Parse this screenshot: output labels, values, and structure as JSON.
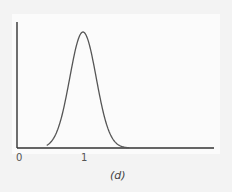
{
  "figure": {
    "caption": "(d)",
    "x_ticks": [
      "0",
      "1"
    ]
  },
  "colors": {
    "axis": "#333333",
    "curve": "#555555",
    "background": "#f3f3f3"
  },
  "chart_data": {
    "type": "line",
    "title": "",
    "caption": "(d)",
    "xlabel": "",
    "ylabel": "",
    "x_tick_labels": [
      "0",
      "1"
    ],
    "y_tick_labels": [],
    "grid": false,
    "legend": null,
    "xlim": [
      0,
      3
    ],
    "ylim": [
      0,
      1.1
    ],
    "series": [
      {
        "name": "density",
        "x": [
          0.45,
          0.55,
          0.65,
          0.75,
          0.85,
          0.95,
          1.0,
          1.05,
          1.15,
          1.25,
          1.35,
          1.45,
          1.55,
          1.7
        ],
        "y": [
          0.0,
          0.03,
          0.12,
          0.33,
          0.65,
          0.93,
          1.0,
          0.95,
          0.74,
          0.45,
          0.22,
          0.08,
          0.02,
          0.0
        ]
      }
    ]
  }
}
